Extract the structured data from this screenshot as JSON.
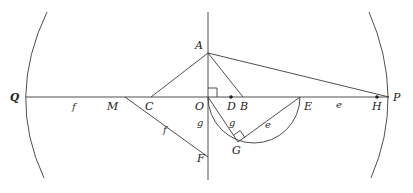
{
  "diagram": {
    "points": {
      "Q": "Q",
      "P": "P",
      "A": "A",
      "O": "O",
      "C": "C",
      "M": "M",
      "D": "D",
      "B": "B",
      "E": "E",
      "H": "H",
      "F": "F",
      "G": "G"
    },
    "segment_labels": {
      "QM": "f",
      "MF": "f",
      "OF": "g",
      "OG": "g",
      "GE": "e",
      "EH": "e"
    },
    "markers": [
      "right-angle-at-O",
      "right-angle-at-G",
      "dot-at-D",
      "dot-at-H"
    ],
    "colors": {
      "stroke": "#3a3a3a",
      "text": "#222222",
      "background": "#ffffff"
    }
  }
}
